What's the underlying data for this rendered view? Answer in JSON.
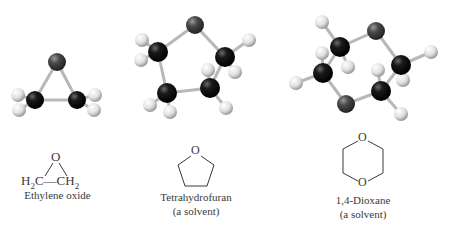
{
  "molecules": [
    {
      "name": "Ethylene oxide",
      "subtitle": "",
      "formula": {
        "left": "H",
        "left_sub": "2",
        "left_c": "C",
        "bond": "—",
        "right": "CH",
        "right_sub": "2",
        "top_atom": "O"
      }
    },
    {
      "name": "Tetrahydrofuran",
      "subtitle": "(a solvent)",
      "ring_atom": "O"
    },
    {
      "name": "1,4-Dioxane",
      "subtitle": "(a solvent)",
      "ring_atoms": [
        "O",
        "O"
      ]
    }
  ],
  "colors": {
    "oxygen": "#4a4a4a",
    "carbon": "#111111",
    "hydrogen": "#e8e8e8",
    "bond": "#b8b8b8",
    "line": "#3a3a3a"
  }
}
